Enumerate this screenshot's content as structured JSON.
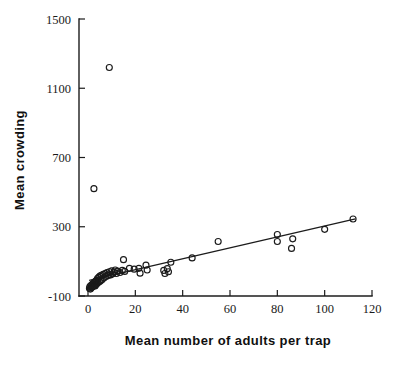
{
  "chart_data": {
    "type": "scatter",
    "title": "",
    "xlabel": "Mean number of adults per trap",
    "ylabel": "Mean crowding",
    "xlim": [
      -8,
      124
    ],
    "ylim": [
      -100,
      1500
    ],
    "xticks": [
      0,
      20,
      40,
      60,
      80,
      100,
      120
    ],
    "xtick_labels": [
      "0",
      "20",
      "40",
      "60",
      "80",
      "100",
      "120"
    ],
    "yticks": [
      -100,
      300,
      700,
      1100,
      1500
    ],
    "ytick_labels": [
      "-100",
      "300",
      "700",
      "1100",
      "1500"
    ],
    "grid": false,
    "legend": null,
    "marker": "open-circle",
    "marker_size": 4,
    "point_color": "#1a1a1a",
    "line_color": "#1c1c1c",
    "fit_line": {
      "name": "regression line",
      "x": [
        0.5,
        113.0
      ],
      "y": [
        -10,
        345
      ]
    },
    "points": [
      {
        "x": 0.6,
        "y": -55
      },
      {
        "x": 0.8,
        "y": -45
      },
      {
        "x": 1.0,
        "y": -60
      },
      {
        "x": 1.2,
        "y": -40
      },
      {
        "x": 1.4,
        "y": -52
      },
      {
        "x": 1.6,
        "y": -35
      },
      {
        "x": 1.8,
        "y": -48
      },
      {
        "x": 2.0,
        "y": -30
      },
      {
        "x": 2.2,
        "y": -44
      },
      {
        "x": 2.4,
        "y": -25
      },
      {
        "x": 2.6,
        "y": -38
      },
      {
        "x": 2.8,
        "y": -20
      },
      {
        "x": 3.0,
        "y": -42
      },
      {
        "x": 3.2,
        "y": -15
      },
      {
        "x": 3.4,
        "y": -33
      },
      {
        "x": 3.6,
        "y": -10
      },
      {
        "x": 3.8,
        "y": -28
      },
      {
        "x": 4.0,
        "y": 0
      },
      {
        "x": 4.2,
        "y": -22
      },
      {
        "x": 4.5,
        "y": 8
      },
      {
        "x": 4.8,
        "y": -18
      },
      {
        "x": 5.0,
        "y": 15
      },
      {
        "x": 5.3,
        "y": -12
      },
      {
        "x": 5.6,
        "y": 20
      },
      {
        "x": 6.0,
        "y": -5
      },
      {
        "x": 6.4,
        "y": 25
      },
      {
        "x": 6.8,
        "y": 5
      },
      {
        "x": 7.2,
        "y": 30
      },
      {
        "x": 7.6,
        "y": 12
      },
      {
        "x": 8.0,
        "y": 35
      },
      {
        "x": 8.5,
        "y": 18
      },
      {
        "x": 9.0,
        "y": 40
      },
      {
        "x": 9.5,
        "y": 22
      },
      {
        "x": 10.0,
        "y": 45
      },
      {
        "x": 10.5,
        "y": 28
      },
      {
        "x": 11.0,
        "y": 38
      },
      {
        "x": 11.5,
        "y": 50
      },
      {
        "x": 12.0,
        "y": 30
      },
      {
        "x": 12.5,
        "y": 44
      },
      {
        "x": 13.5,
        "y": 36
      },
      {
        "x": 14.5,
        "y": 48
      },
      {
        "x": 15.5,
        "y": 42
      },
      {
        "x": 15.0,
        "y": 110
      },
      {
        "x": 17.5,
        "y": 60
      },
      {
        "x": 19.5,
        "y": 55
      },
      {
        "x": 21.5,
        "y": 60
      },
      {
        "x": 22.0,
        "y": 32
      },
      {
        "x": 24.5,
        "y": 78
      },
      {
        "x": 25.0,
        "y": 50
      },
      {
        "x": 32.0,
        "y": 48
      },
      {
        "x": 32.5,
        "y": 30
      },
      {
        "x": 33.5,
        "y": 58
      },
      {
        "x": 34.0,
        "y": 40
      },
      {
        "x": 35.0,
        "y": 95
      },
      {
        "x": 44.0,
        "y": 120
      },
      {
        "x": 55.0,
        "y": 215
      },
      {
        "x": 80.0,
        "y": 255
      },
      {
        "x": 80.0,
        "y": 215
      },
      {
        "x": 86.0,
        "y": 175
      },
      {
        "x": 86.5,
        "y": 230
      },
      {
        "x": 100.0,
        "y": 285
      },
      {
        "x": 112.0,
        "y": 345
      },
      {
        "x": 2.5,
        "y": 520
      },
      {
        "x": 9.0,
        "y": 1220
      }
    ],
    "outliers": [
      {
        "x": 9.0,
        "y": 1220,
        "note": "high outlier"
      },
      {
        "x": 2.5,
        "y": 520,
        "note": "second outlier"
      }
    ]
  }
}
